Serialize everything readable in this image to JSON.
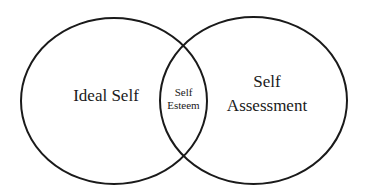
{
  "diagram": {
    "type": "venn",
    "stroke_color": "#1a1a1a",
    "background": "#ffffff",
    "sets": [
      {
        "id": "left",
        "label": "Ideal Self"
      },
      {
        "id": "right",
        "label_lines": [
          "Self",
          "Assessment"
        ]
      }
    ],
    "intersection": {
      "label_lines": [
        "Self",
        "Esteem"
      ]
    }
  }
}
